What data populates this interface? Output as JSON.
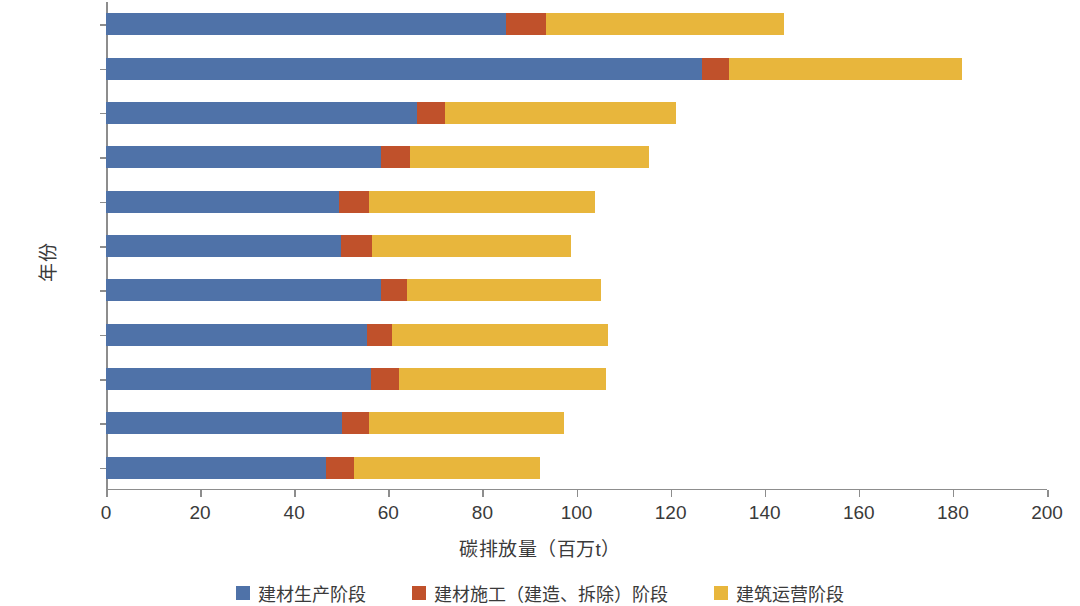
{
  "chart_data": {
    "type": "bar",
    "orientation": "horizontal",
    "stacked": true,
    "title": "",
    "xlabel": "碳排放量（百万t）",
    "ylabel": "年份",
    "categories": [
      "2010",
      "2011",
      "2012",
      "2013",
      "2014",
      "2015",
      "2016",
      "2017",
      "2018",
      "2019",
      "2020"
    ],
    "display_order": [
      "2020",
      "2019",
      "2018",
      "2017",
      "2016",
      "2015",
      "2014",
      "2013",
      "2012",
      "2011",
      "2010"
    ],
    "series": [
      {
        "name": "建材生产阶段",
        "color": "#4f72a8",
        "values": [
          46.7,
          50.2,
          56.4,
          55.4,
          58.5,
          50.0,
          49.6,
          58.5,
          66.2,
          126.6,
          85.1
        ]
      },
      {
        "name": "建材施工（建造、拆除）阶段",
        "color": "#c0512b",
        "values": [
          6.0,
          5.6,
          5.8,
          5.4,
          5.4,
          6.6,
          6.2,
          6.2,
          5.8,
          5.8,
          8.5
        ]
      },
      {
        "name": "建筑运营阶段",
        "color": "#e8b63c",
        "values": [
          39.6,
          41.5,
          44.0,
          45.8,
          41.3,
          42.3,
          48.1,
          50.7,
          49.2,
          49.6,
          50.6
        ]
      }
    ],
    "totals": [
      92.3,
      97.3,
      106.2,
      106.6,
      105.2,
      98.9,
      103.9,
      115.4,
      121.2,
      182.0,
      144.2
    ],
    "xlim": [
      0,
      200
    ],
    "xticks": [
      0,
      20,
      40,
      60,
      80,
      100,
      120,
      140,
      160,
      180,
      200
    ],
    "xtick_labels": [
      "0",
      "20",
      "40",
      "60",
      "80",
      "100",
      "120",
      "140",
      "160",
      "180",
      "200"
    ],
    "grid": false,
    "legend_position": "bottom"
  },
  "axes": {
    "x_title": "碳排放量（百万t）",
    "y_title": "年份"
  },
  "legend": {
    "items": [
      {
        "label": "建材生产阶段",
        "color": "#4f72a8"
      },
      {
        "label": "建材施工（建造、拆除）阶段",
        "color": "#c0512b"
      },
      {
        "label": "建筑运营阶段",
        "color": "#e8b63c"
      }
    ]
  }
}
